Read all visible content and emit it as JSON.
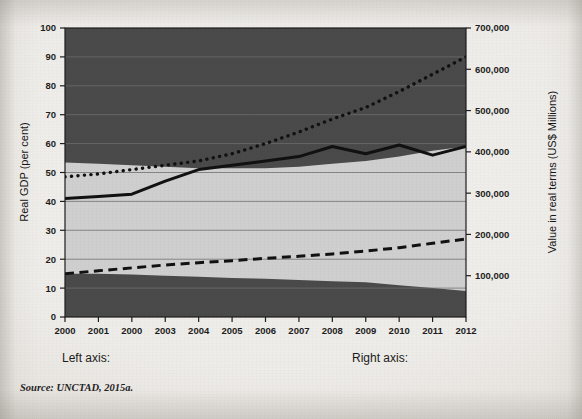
{
  "figure": {
    "source_note": "Source: UNCTAD, 2015a.",
    "legend": {
      "left_axis_label": "Left axis:",
      "right_axis_label": "Right axis:"
    },
    "colors": {
      "paper": "#efedE9",
      "area_dark": "#4a4a4a",
      "area_light": "#cfcfcf",
      "line": "#111111",
      "gridline": "#6f6f6f",
      "text": "#1d1d1d"
    }
  },
  "chart_data": {
    "type": "line",
    "title": "",
    "xlabel": "",
    "ylabel": "Real GDP (per cent)",
    "y2label": "Value in real terms (US$ Millions)",
    "grid": true,
    "legend_position": "bottom",
    "categories": [
      "2000",
      "2001",
      "2000",
      "2003",
      "2004",
      "2005",
      "2006",
      "2007",
      "2008",
      "2009",
      "2010",
      "2011",
      "2012"
    ],
    "x": [
      2000,
      2001,
      2002,
      2003,
      2004,
      2005,
      2006,
      2007,
      2008,
      2009,
      2010,
      2011,
      2012
    ],
    "ylim": [
      0,
      100
    ],
    "yticks": [
      0,
      10,
      20,
      30,
      40,
      50,
      60,
      70,
      80,
      90,
      100
    ],
    "ytick_labels": [
      "0",
      "10",
      "20",
      "30",
      "40",
      "50",
      "60",
      "70",
      "80",
      "90",
      "100"
    ],
    "y2lim": [
      0,
      700000
    ],
    "y2ticks": [
      100000,
      200000,
      300000,
      400000,
      500000,
      600000,
      700000
    ],
    "y2tick_labels": [
      "100,000",
      "200,000",
      "300,000",
      "400,000",
      "500,000",
      "600,000",
      "700,000"
    ],
    "series": [
      {
        "name": "solid-line",
        "axis": "left",
        "style": "solid",
        "color": "#111111",
        "values": [
          41.0,
          41.7,
          42.5,
          47.0,
          51.0,
          52.5,
          54.0,
          55.5,
          59.0,
          56.5,
          59.5,
          56.0,
          59.0
        ]
      },
      {
        "name": "dotted-line",
        "axis": "left",
        "style": "dotted",
        "color": "#111111",
        "values": [
          48.5,
          49.5,
          51.0,
          52.5,
          54.0,
          56.5,
          60.0,
          64.0,
          68.5,
          72.5,
          78.0,
          84.0,
          90.0
        ]
      },
      {
        "name": "dashed-line",
        "axis": "left",
        "style": "dashed",
        "color": "#111111",
        "values": [
          15.0,
          16.0,
          17.0,
          18.0,
          18.8,
          19.5,
          20.3,
          21.0,
          21.8,
          22.8,
          24.0,
          25.5,
          27.0
        ]
      }
    ],
    "areas": [
      {
        "name": "upper-dark-band",
        "axis": "left",
        "color": "#4a4a4a",
        "upper_values": [
          100,
          100,
          100,
          100,
          100,
          100,
          100,
          100,
          100,
          100,
          100,
          100,
          100
        ],
        "lower_values": [
          53.5,
          53.0,
          52.5,
          52.0,
          51.5,
          51.5,
          51.5,
          52.0,
          53.0,
          54.0,
          55.5,
          57.5,
          59.0
        ]
      },
      {
        "name": "lower-dark-band",
        "axis": "left",
        "color": "#4a4a4a",
        "upper_values": [
          15.0,
          15.0,
          14.7,
          14.3,
          13.9,
          13.5,
          13.2,
          12.8,
          12.4,
          12.0,
          11.0,
          10.0,
          9.0
        ],
        "lower_values": [
          0,
          0,
          0,
          0,
          0,
          0,
          0,
          0,
          0,
          0,
          0,
          0,
          0
        ]
      }
    ]
  }
}
